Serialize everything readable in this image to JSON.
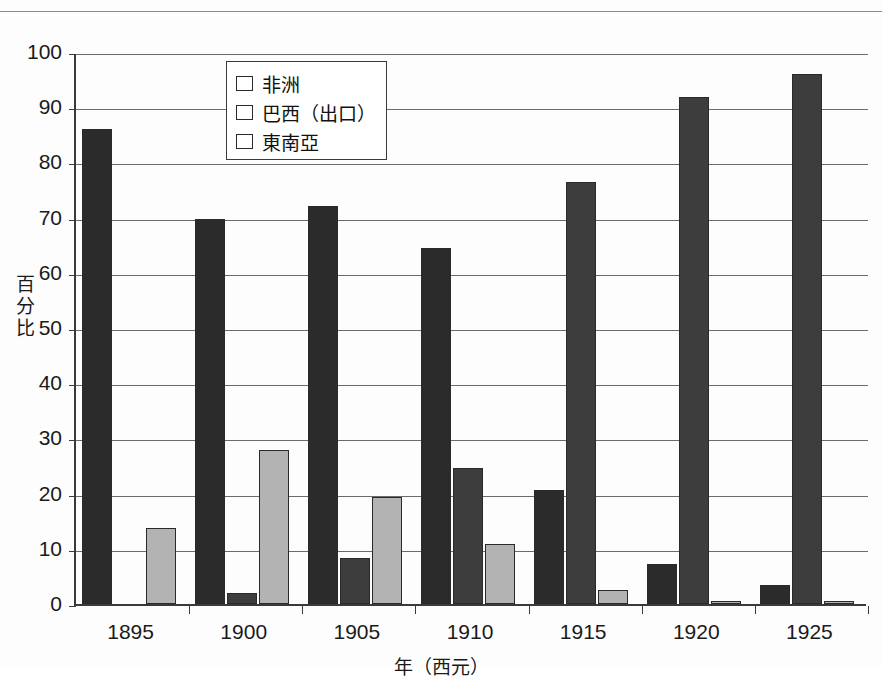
{
  "page": {
    "top_cropped_text": "　　　　　"
  },
  "chart_data": {
    "type": "bar",
    "title": "",
    "xlabel": "年（西元）",
    "ylabel": "百分比",
    "ylabel_chars": [
      "百",
      "分",
      "比"
    ],
    "categories": [
      "1895",
      "1900",
      "1905",
      "1910",
      "1915",
      "1920",
      "1925"
    ],
    "ylim": [
      0,
      100
    ],
    "yticks": [
      0,
      10,
      20,
      30,
      40,
      50,
      60,
      70,
      80,
      90,
      100
    ],
    "grid": true,
    "legend_position": "top-center",
    "series": [
      {
        "name": "非洲",
        "color": "#2b2b2b",
        "values": [
          86.0,
          69.7,
          72.1,
          64.5,
          20.7,
          7.3,
          3.4
        ]
      },
      {
        "name": "東南亞",
        "color": "#3d3d3d",
        "values": [
          0.0,
          0.0,
          8.3,
          24.7,
          76.5,
          91.8,
          96.0
        ]
      },
      {
        "name": "巴西（出口）",
        "color": "#b3b3b3",
        "values": [
          13.8,
          2.0,
          19.3,
          10.8,
          2.5,
          0.6,
          0.5
        ]
      }
    ],
    "dark_gray_extra": {
      "note_1900_value": 27.9,
      "note_1900_series": "巴西（出口）"
    }
  },
  "legend": {
    "items": [
      {
        "label": "非洲",
        "color": "#2b2b2b"
      },
      {
        "label": "巴西（出口）",
        "color": "#b3b3b3"
      },
      {
        "label": "東南亞",
        "color": "#3d3d3d"
      }
    ]
  }
}
